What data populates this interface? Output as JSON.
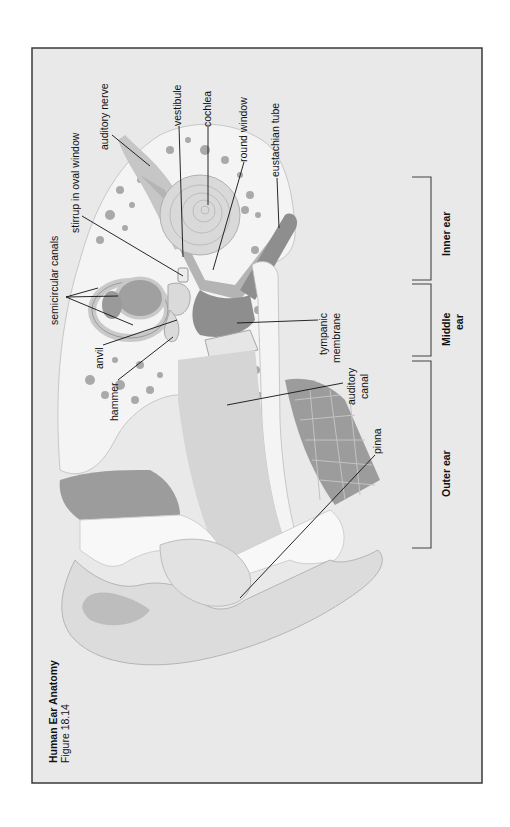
{
  "figure": {
    "title": "Human Ear Anatomy",
    "subtitle": "Figure 18.14",
    "orientation": "rotated 90° counter-clockwise"
  },
  "labels": {
    "semicircular_canals": "semicircular canals",
    "stirrup": "stirrup in oval window",
    "auditory_nerve": "auditory nerve",
    "vestibule": "vestibule",
    "cochlea": "cochlea",
    "round_window": "round window",
    "eustachian_tube": "eustachian tube",
    "anvil": "anvil",
    "hammer": "hammer",
    "tympanic_membrane_1": "tympanic",
    "tympanic_membrane_2": "membrane",
    "auditory_canal_1": "auditory",
    "auditory_canal_2": "canal",
    "pinna": "pinna"
  },
  "regions": {
    "inner_ear": "Inner ear",
    "middle_ear_1": "Middle",
    "middle_ear_2": "ear",
    "outer_ear": "Outer ear"
  },
  "colors": {
    "frame_bg": "#e9e9e9",
    "frame_border": "#3a3a3a",
    "page_bg": "#ffffff",
    "text": "#111111"
  }
}
